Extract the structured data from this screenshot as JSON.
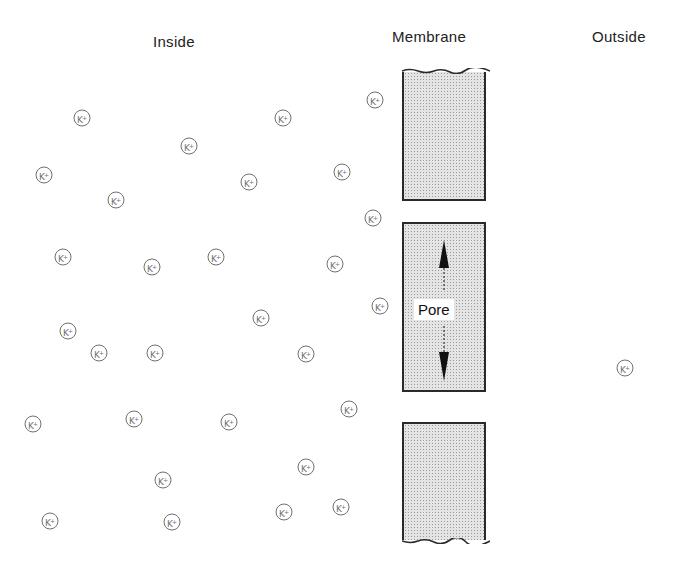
{
  "labels": {
    "inside": "Inside",
    "membrane": "Membrane",
    "outside": "Outside",
    "pore": "Pore"
  },
  "ion_symbol": "K",
  "ion_charge": "+",
  "colors": {
    "ion_stroke": "#707070",
    "membrane_fill": "#e4e4e4",
    "membrane_border": "#2a2a2a"
  },
  "ions": {
    "inside": [
      [
        82,
        118
      ],
      [
        189,
        146
      ],
      [
        283,
        118
      ],
      [
        375,
        100
      ],
      [
        44,
        175
      ],
      [
        116,
        200
      ],
      [
        249,
        182
      ],
      [
        342,
        172
      ],
      [
        373,
        218
      ],
      [
        63,
        257
      ],
      [
        152,
        267
      ],
      [
        216,
        257
      ],
      [
        335,
        264
      ],
      [
        261,
        318
      ],
      [
        380,
        306
      ],
      [
        68,
        331
      ],
      [
        99,
        353
      ],
      [
        155,
        353
      ],
      [
        306,
        354
      ],
      [
        33,
        424
      ],
      [
        134,
        419
      ],
      [
        229,
        422
      ],
      [
        349,
        409
      ],
      [
        163,
        480
      ],
      [
        306,
        467
      ],
      [
        50,
        521
      ],
      [
        172,
        522
      ],
      [
        284,
        512
      ],
      [
        341,
        507
      ]
    ],
    "outside": [
      [
        625,
        368
      ]
    ]
  },
  "membrane": {
    "blocks": [
      {
        "name": "upper",
        "x": 402,
        "y": 70,
        "w": 84,
        "h": 130
      },
      {
        "name": "pore-wall",
        "x": 402,
        "y": 222,
        "w": 84,
        "h": 170
      },
      {
        "name": "lower",
        "x": 402,
        "y": 422,
        "w": 84,
        "h": 120
      }
    ]
  }
}
